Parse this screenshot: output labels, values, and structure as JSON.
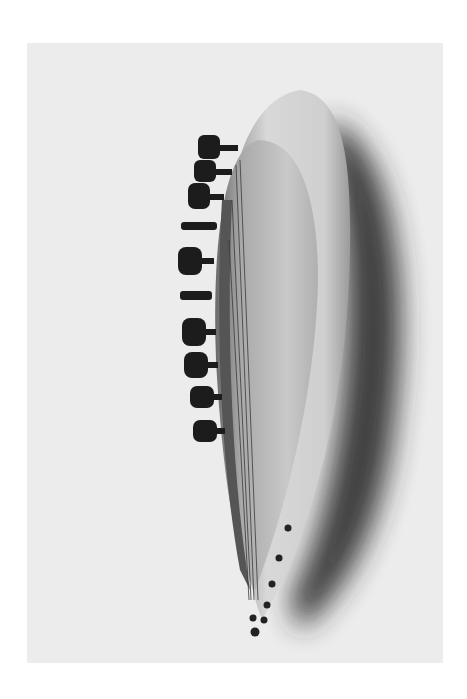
{
  "photo": {
    "subject": "wooden string instrument with tuning pegs",
    "style": "grayscale photograph",
    "colors": {
      "page_background": "#ffffff",
      "backdrop": "#ececec",
      "wood_light": "#d6d6d6",
      "wood_mid": "#b8b8b8",
      "wood_dark": "#6e6e6e",
      "pegs": "#1c1c1c",
      "shadow": "#2a2a2a"
    },
    "peg_count": 10,
    "string_count": 4,
    "tailpiece_pin_count": 7
  }
}
